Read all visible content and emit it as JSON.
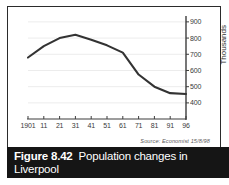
{
  "figure": {
    "caption_number": "Figure 8.42",
    "caption_title": "Population changes in Liverpool",
    "source": "Source: Economist 15/8/98",
    "frame_color": "#2b2b2b",
    "caption_bar_color": "#151515",
    "caption_text_color": "#ffffff"
  },
  "chart_data": {
    "type": "line",
    "title": "Population changes in Liverpool",
    "subtitle": "",
    "xlabel": "",
    "ylabel": "Thousands",
    "x": [
      "1901",
      "11",
      "21",
      "31",
      "41",
      "51",
      "61",
      "71",
      "81",
      "91",
      "96"
    ],
    "x_tick_labels": [
      "1901",
      "11",
      "21",
      "31",
      "41",
      "51",
      "61",
      "71",
      "81",
      "91",
      "96"
    ],
    "y_tick_labels": [
      "900",
      "800",
      "700",
      "600",
      "500",
      "400"
    ],
    "y_ticks": [
      900,
      800,
      700,
      600,
      500,
      400
    ],
    "ylim": [
      350,
      930
    ],
    "series": [
      {
        "name": "Population",
        "values": [
          680,
          750,
          800,
          820,
          790,
          755,
          710,
          575,
          500,
          460,
          455
        ]
      }
    ],
    "line_color": "#333333",
    "grid": true,
    "grid_color": "#ececec",
    "legend": false,
    "axis_color": "#3d3d3d",
    "units": "Thousands"
  }
}
